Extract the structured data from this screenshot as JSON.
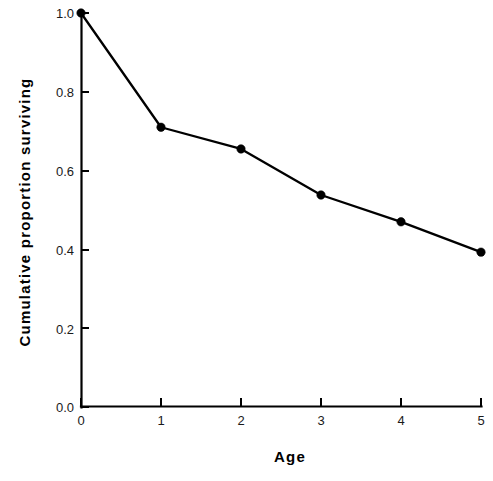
{
  "figure": {
    "background_color": "#ffffff",
    "ink_color": "#000000",
    "caption_fragment": ""
  },
  "chart_data": {
    "type": "line",
    "title": "",
    "subtitle": "",
    "xlabel": "Age",
    "ylabel": "Cumulative  proportion  surviving",
    "x": [
      0,
      1,
      2,
      3,
      4,
      5
    ],
    "values": [
      1.0,
      0.71,
      0.655,
      0.538,
      0.47,
      0.393
    ],
    "series": [
      {
        "name": "Cumulative proportion surviving",
        "values": [
          1.0,
          0.71,
          0.655,
          0.538,
          0.47,
          0.393
        ],
        "marker": "filled-circle",
        "line_color": "#000000",
        "marker_color": "#000000"
      }
    ],
    "xlim": [
      0,
      5
    ],
    "ylim": [
      0.0,
      1.0
    ],
    "xticks": [
      0,
      1,
      2,
      3,
      4,
      5
    ],
    "xtick_labels": [
      "0",
      "1",
      "2",
      "3",
      "4",
      "5"
    ],
    "yticks": [
      0.0,
      0.2,
      0.4,
      0.6,
      0.8,
      1.0
    ],
    "ytick_labels": [
      "0.0",
      "0.2",
      "0.4",
      "0.6",
      "0.8",
      "1.0"
    ],
    "grid": false,
    "legend": false,
    "legend_position": "none",
    "annotations": []
  }
}
